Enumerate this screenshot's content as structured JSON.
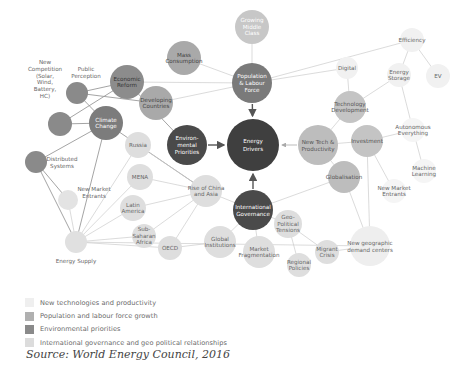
{
  "diagram": {
    "colors": {
      "tech": "#ececec",
      "population": "#b5b5b5",
      "environment": "#8c8c8c",
      "governance": "#d6d6d6",
      "core": "#3f3f3f",
      "line": "#cccccc",
      "dark_line": "#8a8a8a"
    },
    "nodes": [
      {
        "id": "energy-drivers",
        "label": [
          "Energy",
          "Drivers"
        ],
        "x": 253,
        "y": 145,
        "r": 26,
        "fill": "#3f3f3f",
        "text": "#ffffff",
        "category": "core"
      },
      {
        "id": "population-labour-force",
        "label": [
          "Population",
          "& Labour",
          "Force"
        ],
        "x": 252,
        "y": 83,
        "r": 20,
        "fill": "#7a7a7a",
        "text": "#ffffff",
        "category": "population"
      },
      {
        "id": "environmental-priorities",
        "label": [
          "Environ-",
          "mental",
          "Priorities"
        ],
        "x": 187,
        "y": 145,
        "r": 20,
        "fill": "#4a4a4a",
        "text": "#ffffff",
        "category": "environment"
      },
      {
        "id": "new-tech-productivity",
        "label": [
          "New Tech &",
          "Productivity"
        ],
        "x": 318,
        "y": 145,
        "r": 20,
        "fill": "#bdbdbd",
        "text": "#555555",
        "category": "tech"
      },
      {
        "id": "international-governance",
        "label": [
          "International",
          "Governance"
        ],
        "x": 253,
        "y": 210,
        "r": 20,
        "fill": "#4a4a4a",
        "text": "#ffffff",
        "category": "governance"
      },
      {
        "id": "growing-middle-class",
        "label": [
          "Growing",
          "Middle",
          "Class"
        ],
        "x": 252,
        "y": 27,
        "r": 17,
        "fill": "#c7c7c7",
        "text": "#ffffff",
        "category": "population"
      },
      {
        "id": "mass-consumption",
        "label": [
          "Mass",
          "Consumption"
        ],
        "x": 184,
        "y": 58,
        "r": 17,
        "fill": "#a9a9a9",
        "text": "#444444",
        "category": "population"
      },
      {
        "id": "economic-reform",
        "label": [
          "Economic",
          "Reform"
        ],
        "x": 127,
        "y": 82,
        "r": 17,
        "fill": "#8c8c8c",
        "text": "#333333",
        "category": "population"
      },
      {
        "id": "developing-countries",
        "label": [
          "Developing",
          "Countries"
        ],
        "x": 156,
        "y": 103,
        "r": 17,
        "fill": "#a9a9a9",
        "text": "#444444",
        "category": "population"
      },
      {
        "id": "public-perception-node",
        "label": [],
        "x": 77,
        "y": 93,
        "r": 11,
        "fill": "#8a8a8a",
        "text": "#555555",
        "category": "environment"
      },
      {
        "id": "new-competition-node",
        "label": [],
        "x": 60,
        "y": 124,
        "r": 12,
        "fill": "#8a8a8a",
        "text": "#555555",
        "category": "environment"
      },
      {
        "id": "climate-change",
        "label": [
          "Climate",
          "Change"
        ],
        "x": 106,
        "y": 123,
        "r": 17,
        "fill": "#7c7c7c",
        "text": "#ffffff",
        "category": "environment"
      },
      {
        "id": "distributed-systems-node",
        "label": [],
        "x": 36,
        "y": 162,
        "r": 11,
        "fill": "#8a8a8a",
        "text": "#555555",
        "category": "environment"
      },
      {
        "id": "new-market-entrants-left-node",
        "label": [],
        "x": 68,
        "y": 200,
        "r": 10,
        "fill": "#e3e3e3",
        "text": "#555555",
        "category": "tech"
      },
      {
        "id": "energy-supply-node",
        "label": [],
        "x": 76,
        "y": 242,
        "r": 11,
        "fill": "#e0e0e0",
        "text": "#555555",
        "category": "tech"
      },
      {
        "id": "russia",
        "label": [
          "Russia"
        ],
        "x": 138,
        "y": 145,
        "r": 13,
        "fill": "#dedede",
        "text": "#666666",
        "category": "governance"
      },
      {
        "id": "mena",
        "label": [
          "MENA"
        ],
        "x": 140,
        "y": 177,
        "r": 13,
        "fill": "#dedede",
        "text": "#666666",
        "category": "governance"
      },
      {
        "id": "latin-america",
        "label": [
          "Latin",
          "America"
        ],
        "x": 133,
        "y": 208,
        "r": 13,
        "fill": "#dedede",
        "text": "#666666",
        "category": "governance"
      },
      {
        "id": "sub-saharan-africa",
        "label": [
          "Sub-",
          "Saharan",
          "Africa"
        ],
        "x": 144,
        "y": 236,
        "r": 12,
        "fill": "#dedede",
        "text": "#666666",
        "category": "governance"
      },
      {
        "id": "oecd",
        "label": [
          "OECD"
        ],
        "x": 170,
        "y": 248,
        "r": 12,
        "fill": "#dedede",
        "text": "#666666",
        "category": "governance"
      },
      {
        "id": "rise-of-china-asia",
        "label": [
          "Rise of China",
          "and Asia"
        ],
        "x": 206,
        "y": 191,
        "r": 16,
        "fill": "#dedede",
        "text": "#666666",
        "category": "governance"
      },
      {
        "id": "global-institutions",
        "label": [
          "Global",
          "Institutions"
        ],
        "x": 220,
        "y": 242,
        "r": 16,
        "fill": "#dedede",
        "text": "#666666",
        "category": "governance"
      },
      {
        "id": "market-fragmentation",
        "label": [
          "Market",
          "Fragmentation"
        ],
        "x": 259,
        "y": 252,
        "r": 16,
        "fill": "#dedede",
        "text": "#666666",
        "category": "governance"
      },
      {
        "id": "geo-political-tensions",
        "label": [
          "Geo-",
          "Political",
          "Tensions"
        ],
        "x": 288,
        "y": 224,
        "r": 14,
        "fill": "#dedede",
        "text": "#666666",
        "category": "governance"
      },
      {
        "id": "regional-policies",
        "label": [
          "Regional",
          "Policies"
        ],
        "x": 299,
        "y": 265,
        "r": 12,
        "fill": "#dedede",
        "text": "#666666",
        "category": "governance"
      },
      {
        "id": "migrant-crisis",
        "label": [
          "Migrant",
          "Crisis"
        ],
        "x": 327,
        "y": 252,
        "r": 12,
        "fill": "#dedede",
        "text": "#666666",
        "category": "governance"
      },
      {
        "id": "new-geographic-demand-centers",
        "label": [
          "New geographic",
          "demand centers"
        ],
        "x": 370,
        "y": 246,
        "r": 20,
        "fill": "#eeeeee",
        "text": "#666666",
        "category": "tech"
      },
      {
        "id": "globalisation",
        "label": [
          "Globalisation"
        ],
        "x": 344,
        "y": 177,
        "r": 16,
        "fill": "#bdbdbd",
        "text": "#555555",
        "category": "tech"
      },
      {
        "id": "investment",
        "label": [
          "Investment"
        ],
        "x": 367,
        "y": 141,
        "r": 16,
        "fill": "#c4c4c4",
        "text": "#555555",
        "category": "tech"
      },
      {
        "id": "technology-development",
        "label": [
          "Technology",
          "Development"
        ],
        "x": 350,
        "y": 107,
        "r": 16,
        "fill": "#c4c4c4",
        "text": "#555555",
        "category": "tech"
      },
      {
        "id": "digital",
        "label": [
          "Digital"
        ],
        "x": 347,
        "y": 68,
        "r": 11,
        "fill": "#f1f1f1",
        "text": "#666666",
        "category": "tech"
      },
      {
        "id": "energy-storage",
        "label": [
          "Energy",
          "Storage"
        ],
        "x": 399,
        "y": 75,
        "r": 12,
        "fill": "#f1f1f1",
        "text": "#666666",
        "category": "tech"
      },
      {
        "id": "efficiency",
        "label": [
          "Efficiency"
        ],
        "x": 412,
        "y": 40,
        "r": 12,
        "fill": "#f1f1f1",
        "text": "#666666",
        "category": "tech"
      },
      {
        "id": "ev",
        "label": [
          "EV"
        ],
        "x": 438,
        "y": 76,
        "r": 12,
        "fill": "#f1f1f1",
        "text": "#666666",
        "category": "tech"
      },
      {
        "id": "autonomous-everything",
        "label": [
          "Autonomous",
          "Everything"
        ],
        "x": 413,
        "y": 130,
        "r": 12,
        "fill": "#f5f5f5",
        "text": "#666666",
        "category": "tech"
      },
      {
        "id": "machine-learning",
        "label": [
          "Machine",
          "Learning"
        ],
        "x": 424,
        "y": 171,
        "r": 12,
        "fill": "#f5f5f5",
        "text": "#666666",
        "category": "tech"
      },
      {
        "id": "new-market-entrants-right",
        "label": [
          "New Market",
          "Entrants"
        ],
        "x": 394,
        "y": 191,
        "r": 12,
        "fill": "#f5f5f5",
        "text": "#666666",
        "category": "tech"
      }
    ],
    "external_labels": [
      {
        "id": "new-competition-label",
        "lines": [
          "New",
          "Competition",
          "(Solar,",
          "Wind,",
          "Battery,",
          "HC)"
        ],
        "x": 45,
        "y": 64
      },
      {
        "id": "public-perception-label",
        "lines": [
          "Public",
          "Perception"
        ],
        "x": 86,
        "y": 71
      },
      {
        "id": "distributed-systems-label",
        "lines": [
          "Distributed",
          "Systems"
        ],
        "x": 62,
        "y": 161
      },
      {
        "id": "new-market-entrants-left-label",
        "lines": [
          "New Market",
          "Entrants"
        ],
        "x": 94,
        "y": 191
      },
      {
        "id": "energy-supply-label",
        "lines": [
          "Energy Supply"
        ],
        "x": 76,
        "y": 263
      }
    ],
    "edges": [
      [
        "public-perception-node",
        "economic-reform"
      ],
      [
        "public-perception-node",
        "developing-countries"
      ],
      [
        "public-perception-node",
        "climate-change"
      ],
      [
        "new-competition-node",
        "economic-reform"
      ],
      [
        "new-competition-node",
        "climate-change"
      ],
      [
        "climate-change",
        "distributed-systems-node"
      ],
      [
        "climate-change",
        "energy-supply-node"
      ],
      [
        "climate-change",
        "rise-of-china-asia"
      ],
      [
        "distributed-systems-node",
        "new-market-entrants-left-node"
      ],
      [
        "distributed-systems-node",
        "energy-supply-node"
      ],
      [
        "new-market-entrants-left-node",
        "energy-supply-node"
      ],
      [
        "economic-reform",
        "population-labour-force"
      ],
      [
        "mass-consumption",
        "population-labour-force"
      ],
      [
        "developing-countries",
        "population-labour-force"
      ],
      [
        "growing-middle-class",
        "population-labour-force"
      ],
      [
        "population-labour-force",
        "efficiency"
      ],
      [
        "population-labour-force",
        "digital"
      ],
      [
        "economic-reform",
        "environmental-priorities"
      ],
      [
        "russia",
        "rise-of-china-asia"
      ],
      [
        "mena",
        "rise-of-china-asia"
      ],
      [
        "latin-america",
        "rise-of-china-asia"
      ],
      [
        "sub-saharan-africa",
        "rise-of-china-asia"
      ],
      [
        "oecd",
        "rise-of-china-asia"
      ],
      [
        "rise-of-china-asia",
        "international-governance"
      ],
      [
        "oecd",
        "global-institutions"
      ],
      [
        "energy-supply-node",
        "russia"
      ],
      [
        "energy-supply-node",
        "mena"
      ],
      [
        "energy-supply-node",
        "latin-america"
      ],
      [
        "energy-supply-node",
        "sub-saharan-africa"
      ],
      [
        "energy-supply-node",
        "oecd"
      ],
      [
        "energy-supply-node",
        "new-geographic-demand-centers"
      ],
      [
        "global-institutions",
        "international-governance"
      ],
      [
        "market-fragmentation",
        "international-governance"
      ],
      [
        "geo-political-tensions",
        "international-governance"
      ],
      [
        "regional-policies",
        "geo-political-tensions"
      ],
      [
        "migrant-crisis",
        "geo-political-tensions"
      ],
      [
        "new-geographic-demand-centers",
        "globalisation"
      ],
      [
        "new-geographic-demand-centers",
        "investment"
      ],
      [
        "new-geographic-demand-centers",
        "migrant-crisis"
      ],
      [
        "technology-development",
        "new-tech-productivity"
      ],
      [
        "investment",
        "new-tech-productivity"
      ],
      [
        "globalisation",
        "new-tech-productivity"
      ],
      [
        "technology-development",
        "digital"
      ],
      [
        "technology-development",
        "energy-storage"
      ],
      [
        "energy-storage",
        "efficiency"
      ],
      [
        "ev",
        "efficiency"
      ],
      [
        "investment",
        "autonomous-everything"
      ],
      [
        "autonomous-everything",
        "energy-storage"
      ],
      [
        "autonomous-everything",
        "machine-learning"
      ],
      [
        "investment",
        "new-market-entrants-right"
      ],
      [
        "globalisation",
        "international-governance"
      ]
    ],
    "arrows": [
      {
        "from": "population-labour-force",
        "to": "energy-drivers",
        "dark": true
      },
      {
        "from": "environmental-priorities",
        "to": "energy-drivers",
        "dark": true
      },
      {
        "from": "international-governance",
        "to": "energy-drivers",
        "dark": true
      },
      {
        "from": "new-tech-productivity",
        "to": "energy-drivers",
        "dark": false
      }
    ]
  },
  "legend": {
    "items": [
      {
        "label": "New technologies and productivity",
        "color": "#efefef"
      },
      {
        "label": "Population and labour force growth",
        "color": "#b0b0b0"
      },
      {
        "label": "Environmental priorities",
        "color": "#8a8a8a"
      },
      {
        "label": "International governance and geo political relationships",
        "color": "#dcdcdc"
      }
    ]
  },
  "source": "Source: World Energy Council, 2016"
}
